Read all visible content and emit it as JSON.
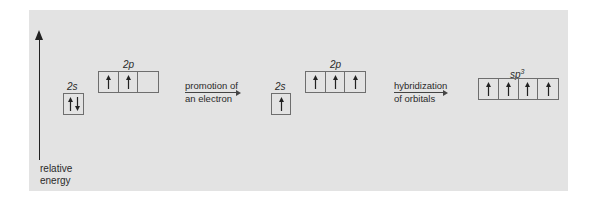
{
  "axis": {
    "label_line1": "relative",
    "label_line2": "energy"
  },
  "ground_state": {
    "s_label": "2s",
    "p_label": "2p",
    "s_orbital": [
      [
        "up",
        "down"
      ]
    ],
    "p_orbitals": [
      [
        "up"
      ],
      [
        "up"
      ],
      []
    ]
  },
  "step1": {
    "line1": "promotion of",
    "line2": "an electron"
  },
  "excited_state": {
    "s_label": "2s",
    "p_label": "2p",
    "s_orbital": [
      [
        "up"
      ]
    ],
    "p_orbitals": [
      [
        "up"
      ],
      [
        "up"
      ],
      [
        "up"
      ]
    ]
  },
  "step2": {
    "line1": "hybridization",
    "line2": "of orbitals"
  },
  "hybrid_state": {
    "label_base": "sp",
    "label_sup": "3",
    "orbitals": [
      [
        "up"
      ],
      [
        "up"
      ],
      [
        "up"
      ],
      [
        "up"
      ]
    ]
  },
  "colors": {
    "panel": "#e3e3e3",
    "ink": "#222222",
    "box_border": "#6e6e6e"
  }
}
